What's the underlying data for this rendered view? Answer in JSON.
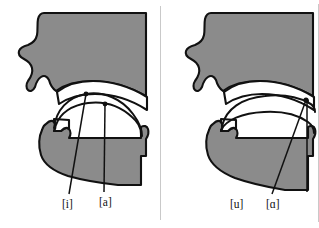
{
  "figure": {
    "type": "sagittal-vocal-tract-diagram",
    "panel_count": 2,
    "background_color": "#ffffff",
    "tissue_color": "#8b8b8b",
    "outline_color": "#111111",
    "cavity_color": "#ffffff"
  },
  "panels": [
    {
      "id": "left",
      "name": "front-vowels-panel",
      "labels": [
        {
          "text": "[i]",
          "name": "label-i",
          "x": 62,
          "y": 199
        },
        {
          "text": "[a]",
          "name": "label-a",
          "x": 99,
          "y": 197
        }
      ]
    },
    {
      "id": "right",
      "name": "back-vowels-panel",
      "labels": [
        {
          "text": "[u]",
          "name": "label-u",
          "x": 230,
          "y": 199
        },
        {
          "text": "[ɑ]",
          "name": "label-script-a",
          "x": 266,
          "y": 199
        }
      ]
    }
  ]
}
